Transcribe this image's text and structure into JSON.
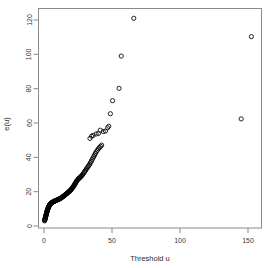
{
  "chart_data": {
    "type": "scatter",
    "title": "",
    "subtitle": "",
    "xlabel": "Threshold u",
    "ylabel": "e(u)",
    "xlim": [
      -4,
      162
    ],
    "ylim": [
      -3,
      127
    ],
    "xticks": [
      0,
      50,
      100,
      150
    ],
    "xtick_labels": [
      "0",
      "50",
      "100",
      "150"
    ],
    "yticks": [
      0,
      20,
      40,
      60,
      80,
      100,
      120
    ],
    "ytick_labels": [
      "0",
      "20",
      "40",
      "60",
      "80",
      "100",
      "120"
    ],
    "grid": false,
    "legend": null,
    "marker": "open-circle",
    "marker_color": "#000000",
    "marker_size": 2.1,
    "box": true,
    "series": [
      {
        "name": "mean excess",
        "points": [
          [
            0.4,
            3.0
          ],
          [
            0.5,
            3.3
          ],
          [
            0.6,
            3.6
          ],
          [
            0.7,
            3.9
          ],
          [
            0.8,
            4.2
          ],
          [
            0.9,
            4.5
          ],
          [
            1.0,
            4.8
          ],
          [
            1.1,
            5.1
          ],
          [
            1.2,
            5.4
          ],
          [
            1.3,
            5.7
          ],
          [
            1.4,
            6.0
          ],
          [
            1.5,
            6.3
          ],
          [
            1.6,
            6.6
          ],
          [
            1.7,
            6.9
          ],
          [
            1.8,
            7.2
          ],
          [
            1.9,
            7.5
          ],
          [
            2.0,
            7.8
          ],
          [
            2.1,
            8.1
          ],
          [
            2.2,
            8.4
          ],
          [
            2.3,
            8.6
          ],
          [
            2.4,
            8.9
          ],
          [
            2.5,
            9.1
          ],
          [
            2.6,
            9.4
          ],
          [
            2.7,
            9.6
          ],
          [
            2.8,
            9.8
          ],
          [
            2.9,
            10.0
          ],
          [
            3.0,
            10.3
          ],
          [
            3.1,
            10.5
          ],
          [
            3.2,
            10.7
          ],
          [
            3.3,
            10.9
          ],
          [
            3.4,
            11.1
          ],
          [
            3.5,
            11.3
          ],
          [
            3.6,
            11.5
          ],
          [
            3.7,
            11.6
          ],
          [
            3.8,
            11.8
          ],
          [
            3.9,
            12.0
          ],
          [
            4.0,
            12.2
          ],
          [
            4.2,
            12.4
          ],
          [
            4.4,
            12.6
          ],
          [
            4.6,
            12.8
          ],
          [
            4.8,
            12.9
          ],
          [
            5.0,
            13.1
          ],
          [
            5.2,
            13.2
          ],
          [
            5.4,
            13.4
          ],
          [
            5.6,
            13.5
          ],
          [
            5.8,
            13.6
          ],
          [
            6.0,
            13.7
          ],
          [
            6.2,
            13.8
          ],
          [
            6.4,
            13.9
          ],
          [
            6.6,
            14.0
          ],
          [
            6.8,
            14.1
          ],
          [
            7.0,
            14.2
          ],
          [
            7.2,
            14.3
          ],
          [
            7.4,
            14.3
          ],
          [
            7.6,
            14.4
          ],
          [
            7.8,
            14.5
          ],
          [
            8.0,
            14.6
          ],
          [
            8.3,
            14.7
          ],
          [
            8.6,
            14.8
          ],
          [
            8.9,
            14.9
          ],
          [
            9.2,
            15.0
          ],
          [
            9.5,
            15.1
          ],
          [
            9.8,
            15.2
          ],
          [
            10.1,
            15.3
          ],
          [
            10.4,
            15.4
          ],
          [
            10.7,
            15.5
          ],
          [
            11.0,
            15.7
          ],
          [
            11.3,
            15.8
          ],
          [
            11.6,
            15.9
          ],
          [
            11.9,
            16.0
          ],
          [
            12.2,
            16.2
          ],
          [
            12.5,
            16.3
          ],
          [
            12.8,
            16.5
          ],
          [
            13.1,
            16.6
          ],
          [
            13.4,
            16.8
          ],
          [
            13.7,
            17.0
          ],
          [
            14.0,
            17.2
          ],
          [
            14.3,
            17.3
          ],
          [
            14.6,
            17.5
          ],
          [
            14.9,
            17.7
          ],
          [
            15.2,
            17.9
          ],
          [
            15.5,
            18.1
          ],
          [
            15.8,
            18.3
          ],
          [
            16.1,
            18.5
          ],
          [
            16.4,
            18.7
          ],
          [
            16.7,
            18.9
          ],
          [
            17.0,
            19.1
          ],
          [
            17.3,
            19.3
          ],
          [
            17.6,
            19.5
          ],
          [
            17.9,
            19.7
          ],
          [
            18.2,
            19.9
          ],
          [
            18.5,
            20.1
          ],
          [
            18.8,
            20.3
          ],
          [
            19.1,
            20.6
          ],
          [
            19.4,
            20.8
          ],
          [
            19.7,
            21.0
          ],
          [
            20.0,
            21.3
          ],
          [
            20.3,
            21.6
          ],
          [
            20.6,
            21.9
          ],
          [
            20.9,
            22.2
          ],
          [
            21.2,
            22.5
          ],
          [
            21.5,
            22.9
          ],
          [
            21.8,
            23.2
          ],
          [
            22.1,
            23.6
          ],
          [
            22.4,
            24.0
          ],
          [
            22.7,
            24.4
          ],
          [
            23.0,
            24.8
          ],
          [
            23.3,
            25.2
          ],
          [
            23.6,
            25.6
          ],
          [
            23.9,
            26.0
          ],
          [
            24.2,
            26.4
          ],
          [
            24.6,
            26.8
          ],
          [
            25.0,
            27.2
          ],
          [
            25.4,
            27.5
          ],
          [
            25.8,
            27.8
          ],
          [
            26.2,
            28.1
          ],
          [
            26.6,
            28.4
          ],
          [
            27.0,
            28.7
          ],
          [
            27.5,
            29.1
          ],
          [
            28.0,
            29.5
          ],
          [
            28.5,
            30.0
          ],
          [
            29.0,
            30.6
          ],
          [
            29.5,
            31.2
          ],
          [
            30.0,
            31.8
          ],
          [
            30.6,
            32.5
          ],
          [
            31.2,
            33.2
          ],
          [
            31.8,
            33.9
          ],
          [
            32.4,
            34.6
          ],
          [
            33.0,
            35.3
          ],
          [
            33.6,
            36.0
          ],
          [
            34.2,
            36.9
          ],
          [
            34.8,
            37.8
          ],
          [
            35.4,
            38.7
          ],
          [
            36.0,
            39.6
          ],
          [
            36.6,
            40.5
          ],
          [
            37.2,
            41.4
          ],
          [
            37.8,
            42.3
          ],
          [
            38.4,
            43.2
          ],
          [
            39.2,
            44.1
          ],
          [
            40.0,
            45.0
          ],
          [
            40.8,
            45.7
          ],
          [
            41.6,
            46.4
          ],
          [
            42.4,
            47.1
          ],
          [
            33.8,
            51.0
          ],
          [
            35.0,
            52.3
          ],
          [
            36.2,
            52.8
          ],
          [
            38.4,
            53.6
          ],
          [
            40.0,
            53.9
          ],
          [
            41.4,
            55.8
          ],
          [
            43.6,
            55.0
          ],
          [
            45.2,
            55.3
          ],
          [
            46.8,
            57.2
          ],
          [
            47.6,
            58.1
          ],
          [
            48.8,
            65.4
          ],
          [
            50.4,
            73.0
          ],
          [
            55.2,
            80.2
          ],
          [
            56.8,
            99.0
          ],
          [
            66.0,
            121.0
          ],
          [
            145.0,
            62.4
          ],
          [
            152.5,
            110.3
          ]
        ]
      }
    ]
  },
  "axes": {
    "x_axis_name": "x-axis",
    "y_axis_name": "y-axis"
  }
}
